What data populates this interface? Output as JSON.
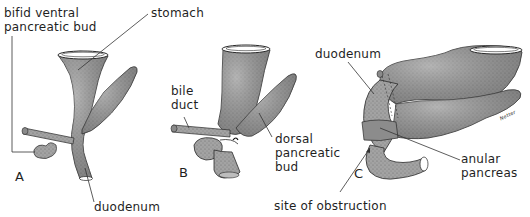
{
  "figure": {
    "colors": {
      "background": "#ffffff",
      "tissue": "#9a9a9a",
      "tissue_dark": "#5e5e5e",
      "outline": "#2a2a2a",
      "leader_line": "#333333",
      "text": "#1f1f1f"
    },
    "panels": [
      {
        "letter": "A",
        "labels": [
          {
            "line1": "bifid ventral",
            "line2": "pancreatic bud"
          },
          {
            "line1": "stomach"
          },
          {
            "line1": "duodenum"
          }
        ]
      },
      {
        "letter": "B",
        "labels": [
          {
            "line1": "bile",
            "line2": "duct"
          },
          {
            "line1": "dorsal",
            "line2": "pancreatic",
            "line3": "bud"
          }
        ]
      },
      {
        "letter": "C",
        "labels": [
          {
            "line1": "duodenum"
          },
          {
            "line1": "anular",
            "line2": "pancreas"
          },
          {
            "line1": "site of obstruction"
          }
        ],
        "signature": "Netter"
      }
    ]
  }
}
